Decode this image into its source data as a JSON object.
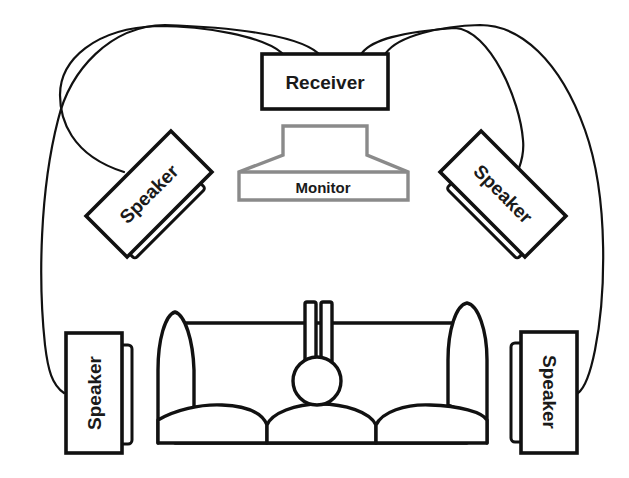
{
  "diagram": {
    "title": "",
    "type": "home theater surround sound speaker placement",
    "colors": {
      "line": "#111111",
      "monitor_outline": "#8a8a8a",
      "background": "#ffffff"
    },
    "receiver": {
      "label": "Receiver"
    },
    "monitor": {
      "label": "Monitor"
    },
    "speakers": [
      {
        "position": "front-left",
        "label": "Speaker"
      },
      {
        "position": "front-right",
        "label": "Speaker"
      },
      {
        "position": "rear-left",
        "label": "Speaker"
      },
      {
        "position": "rear-right",
        "label": "Speaker"
      }
    ],
    "listener": {
      "description": "person seated on sofa, viewed from above"
    },
    "sofa": {
      "description": "three-seat sofa with two arms"
    },
    "connections": [
      {
        "from": "receiver",
        "to": "front-left speaker"
      },
      {
        "from": "receiver",
        "to": "rear-left speaker"
      },
      {
        "from": "receiver",
        "to": "front-right speaker"
      },
      {
        "from": "receiver",
        "to": "rear-right speaker"
      }
    ]
  }
}
